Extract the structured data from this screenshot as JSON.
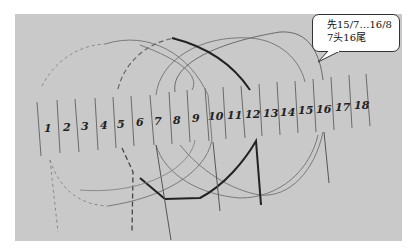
{
  "drawing": {
    "numbers": [
      "1",
      "2",
      "3",
      "4",
      "5",
      "6",
      "7",
      "8",
      "9",
      "10",
      "11",
      "12",
      "13",
      "14",
      "15",
      "16",
      "17",
      "18"
    ]
  },
  "callout": {
    "line1": "先15/7…16/8",
    "line2": "7头16尾"
  }
}
